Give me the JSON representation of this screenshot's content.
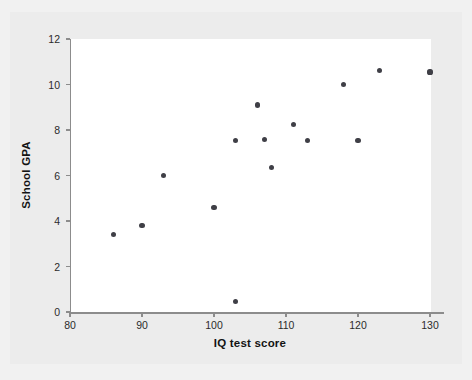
{
  "chart_data": {
    "type": "scatter",
    "title": "",
    "xlabel": "IQ test score",
    "ylabel": "School GPA",
    "xlim": [
      80,
      132
    ],
    "ylim": [
      0,
      12
    ],
    "xticks": [
      80,
      90,
      100,
      110,
      120,
      130
    ],
    "yticks": [
      0,
      2,
      4,
      6,
      8,
      10,
      12
    ],
    "grid": false,
    "legend": null,
    "marker_color": "#3f3f46",
    "points": [
      {
        "x": 86,
        "y": 3.4
      },
      {
        "x": 90,
        "y": 3.8
      },
      {
        "x": 93,
        "y": 6.0
      },
      {
        "x": 100,
        "y": 4.6
      },
      {
        "x": 103,
        "y": 7.55
      },
      {
        "x": 103,
        "y": 0.45
      },
      {
        "x": 106,
        "y": 9.1
      },
      {
        "x": 107,
        "y": 7.6
      },
      {
        "x": 108,
        "y": 6.35
      },
      {
        "x": 111,
        "y": 8.25
      },
      {
        "x": 113,
        "y": 7.55
      },
      {
        "x": 118,
        "y": 10.0
      },
      {
        "x": 120,
        "y": 7.55
      },
      {
        "x": 123,
        "y": 10.6
      },
      {
        "x": 130,
        "y": 10.55
      }
    ]
  },
  "figure": {
    "background_color": "#f1f1f1",
    "plot_background_color": "#ffffff",
    "axis_color": "#8c8c8c"
  }
}
